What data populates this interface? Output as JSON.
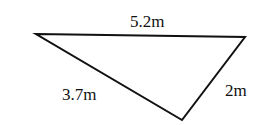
{
  "diagram": {
    "type": "triangle",
    "vertices": [
      [
        36,
        34
      ],
      [
        245,
        37
      ],
      [
        182,
        120
      ]
    ],
    "sides": [
      {
        "label": "5.2m",
        "from": 0,
        "to": 1
      },
      {
        "label": "3.7m",
        "from": 0,
        "to": 2
      },
      {
        "label": "2m",
        "from": 1,
        "to": 2
      }
    ],
    "stroke_color": "#111111"
  }
}
